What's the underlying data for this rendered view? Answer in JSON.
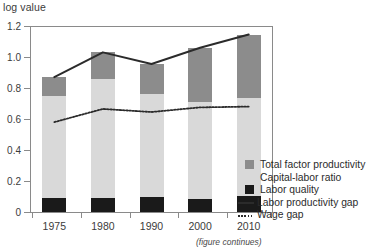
{
  "chart_data": {
    "type": "bar",
    "subtype": "stacked-bar-with-lines",
    "title": "",
    "ylabel": "log value",
    "xlabel": "",
    "categories": [
      "1975",
      "1980",
      "1990",
      "2000",
      "2010"
    ],
    "ylim": [
      0,
      1.2
    ],
    "yticks": [
      0,
      0.2,
      0.4,
      0.6,
      0.8,
      1.0,
      1.2
    ],
    "ytick_labels": [
      "0",
      "0.2",
      "0.4",
      "0.6",
      "0.8",
      "1.0",
      "1.2"
    ],
    "grid": false,
    "legend_position": "right-bottom",
    "series": [
      {
        "name": "Labor quality",
        "kind": "bar-segment",
        "stack_order": 1,
        "color": "#1a1a1a",
        "values": [
          0.09,
          0.09,
          0.095,
          0.085,
          0.105
        ]
      },
      {
        "name": "Capital-labor ratio",
        "kind": "bar-segment",
        "stack_order": 2,
        "color": "#d9d9d9",
        "values": [
          0.66,
          0.77,
          0.665,
          0.625,
          0.63
        ]
      },
      {
        "name": "Total factor productivity",
        "kind": "bar-segment",
        "stack_order": 3,
        "color": "#8c8c8c",
        "values": [
          0.12,
          0.17,
          0.195,
          0.35,
          0.41
        ]
      },
      {
        "name": "Labor productivity gap",
        "kind": "line-solid",
        "color": "#2b2b2b",
        "values": [
          0.87,
          1.03,
          0.955,
          1.06,
          1.145
        ]
      },
      {
        "name": "Wage gap",
        "kind": "line-dotted",
        "color": "#2b2b2b",
        "values": [
          0.58,
          0.665,
          0.645,
          0.675,
          0.68
        ]
      }
    ],
    "bar_totals": [
      0.87,
      1.03,
      0.955,
      1.06,
      1.145
    ],
    "annotations": [
      {
        "text": "(figure continues)",
        "style": "italic",
        "position": "bottom-right"
      }
    ]
  },
  "legend": {
    "items": [
      {
        "label": "Total factor productivity",
        "mark": "swatch-dark-gray"
      },
      {
        "label": "Capital-labor ratio",
        "mark": "swatch-light-gray"
      },
      {
        "label": "Labor quality",
        "mark": "swatch-black"
      },
      {
        "label": "Labor productivity gap",
        "mark": "line-solid"
      },
      {
        "label": "Wage gap",
        "mark": "line-dotted"
      }
    ]
  },
  "colors": {
    "total_factor_productivity": "#8c8c8c",
    "capital_labor_ratio": "#d9d9d9",
    "labor_quality": "#1a1a1a",
    "line": "#2b2b2b",
    "axis": "#8a8a8a",
    "text": "#3b3b3b",
    "background": "#ffffff"
  },
  "footnote": "(figure continues)"
}
